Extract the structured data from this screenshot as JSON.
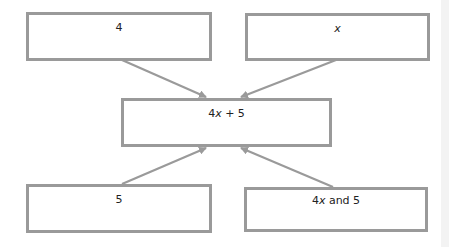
{
  "diagram": {
    "type": "flow",
    "colors": {
      "box_border": "#9a9a9a",
      "arrow": "#9a9a9a",
      "text": "#222222"
    },
    "boxes": [
      {
        "id": "top-left",
        "label": "4"
      },
      {
        "id": "top-right",
        "label": "x"
      },
      {
        "id": "center",
        "label_parts": [
          "4",
          "x",
          " + 5"
        ]
      },
      {
        "id": "bottom-left",
        "label": "5"
      },
      {
        "id": "bottom-right",
        "label_parts": [
          "4",
          "x",
          " and 5"
        ]
      }
    ],
    "edges": [
      {
        "from": "top-left",
        "to": "center"
      },
      {
        "from": "top-right",
        "to": "center"
      },
      {
        "from": "bottom-left",
        "to": "center"
      },
      {
        "from": "bottom-right",
        "to": "center"
      }
    ]
  }
}
